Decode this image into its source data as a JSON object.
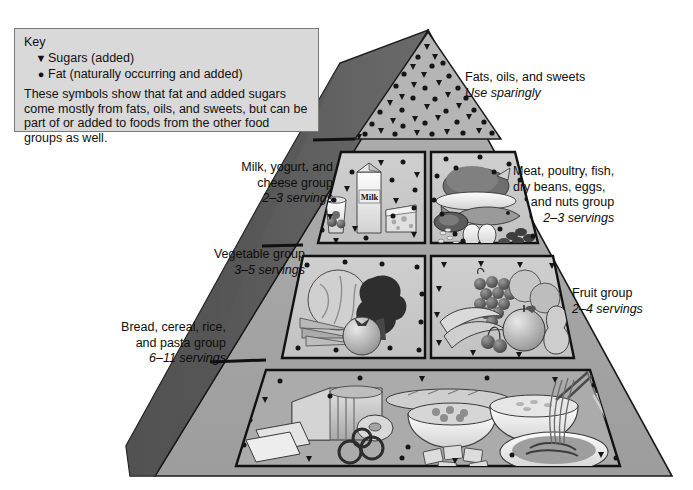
{
  "key": {
    "title": "Key",
    "entries": [
      {
        "symbol": "▼",
        "symbol_name": "sugars-triangle-icon",
        "label": "Sugars (added)"
      },
      {
        "symbol": "●",
        "symbol_name": "fat-dot-icon",
        "label": "Fat (naturally occurring and added)"
      }
    ],
    "note": "These symbols show that fat and added sugars come mostly from fats, oils, and sweets, but can be part of or added to foods from the other food groups as well."
  },
  "labels": {
    "fats": {
      "line1": "Fats, oils, and sweets",
      "line2": "Use sparingly"
    },
    "milk": {
      "line1": "Milk, yogurt, and",
      "line2": "cheese group",
      "line3": "2–3 servings"
    },
    "meat": {
      "line1": "Meat, poultry, fish,",
      "line2": "dry beans, eggs,",
      "line3": "and nuts group",
      "line4": "2–3 servings"
    },
    "vegetable": {
      "line1": "Vegetable group",
      "line2": "3–5 servings"
    },
    "fruit": {
      "line1": "Fruit group",
      "line2": "2–4 servings"
    },
    "bread": {
      "line1": "Bread, cereal, rice,",
      "line2": "and pasta group",
      "line3": "6–11 servings"
    }
  },
  "pyramid": {
    "milk_carton_text": "Milk",
    "tiers": [
      {
        "name": "fats-oils-sweets",
        "group": "Fats, oils, and sweets",
        "servings": "Use sparingly"
      },
      {
        "name": "milk-yogurt-cheese",
        "group": "Milk, yogurt, and cheese group",
        "servings": "2–3 servings"
      },
      {
        "name": "meat-poultry-fish",
        "group": "Meat, poultry, fish, dry beans, eggs, and nuts group",
        "servings": "2–3 servings"
      },
      {
        "name": "vegetable",
        "group": "Vegetable group",
        "servings": "3–5 servings"
      },
      {
        "name": "fruit",
        "group": "Fruit group",
        "servings": "2–4 servings"
      },
      {
        "name": "bread-cereal-rice-pasta",
        "group": "Bread, cereal, rice, and pasta group",
        "servings": "6–11 servings"
      }
    ]
  },
  "colors": {
    "key_background": "#d9d9d9",
    "key_border": "#7a7a7a",
    "pyramid_face": "#a8a8a8",
    "pyramid_side_dark": "#5b5b5b",
    "panel_light": "#c9c9c9",
    "outline": "#111111",
    "text": "#0d0d0d"
  }
}
